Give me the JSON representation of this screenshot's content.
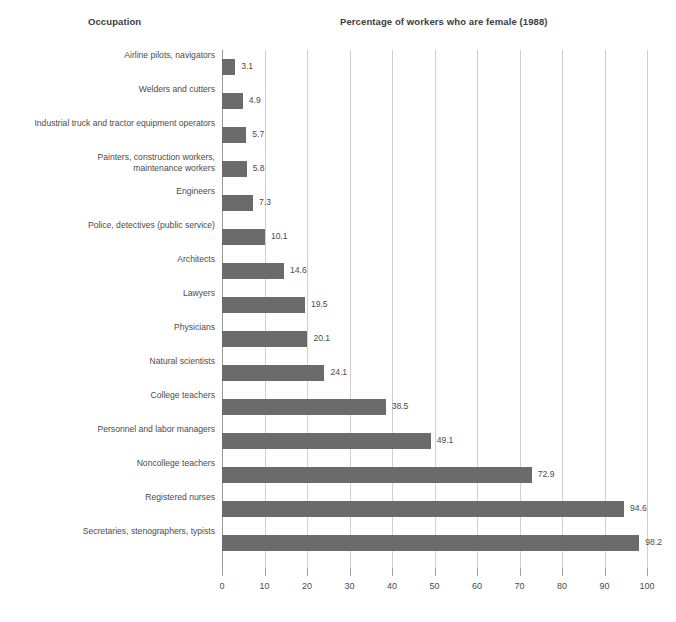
{
  "headers": {
    "category_header": "Occupation",
    "value_header": "Percentage of workers who are female (1988)"
  },
  "chart_data": {
    "type": "bar",
    "orientation": "horizontal",
    "title": "Percentage of workers who are female (1988)",
    "xlabel": "",
    "ylabel": "Occupation",
    "xlim": [
      0,
      100
    ],
    "xticks": [
      0,
      10,
      20,
      30,
      40,
      50,
      60,
      70,
      80,
      90,
      100
    ],
    "xtick_labels": [
      "0",
      "10",
      "20",
      "30",
      "40",
      "50",
      "60",
      "70",
      "80",
      "90",
      "100"
    ],
    "grid": "vertical",
    "legend": "none",
    "bar_color": "#6b6b6b",
    "categories": [
      "Airline pilots, navigators",
      "Welders and cutters",
      "Industrial truck and tractor equipment operators",
      "Painters, construction workers,\nmaintenance workers",
      "Engineers",
      "Police, detectives (public service)",
      "Architects",
      "Lawyers",
      "Physicians",
      "Natural scientists",
      "College teachers",
      "Personnel and labor managers",
      "Noncollege teachers",
      "Registered nurses",
      "Secretaries, stenographers, typists"
    ],
    "values": [
      3.1,
      4.9,
      5.7,
      5.8,
      7.3,
      10.1,
      14.6,
      19.5,
      20.1,
      24.1,
      38.5,
      49.1,
      72.9,
      94.6,
      98.2
    ],
    "value_labels": [
      "3.1",
      "4.9",
      "5.7",
      "5.8",
      "7.3",
      "10.1",
      "14.6",
      "19.5",
      "20.1",
      "24.1",
      "38.5",
      "49.1",
      "72.9",
      "94.6",
      "98.2"
    ]
  }
}
